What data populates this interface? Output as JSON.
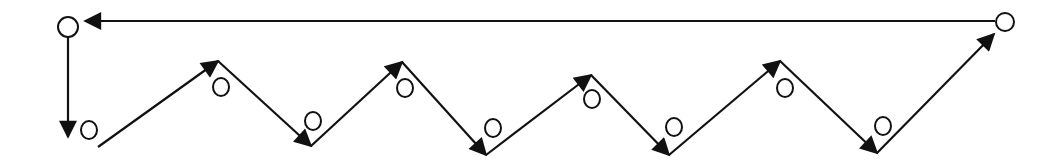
{
  "diagram": {
    "type": "zigzag-cycle-path",
    "stroke_color": "#111111",
    "background": "#ffffff",
    "top_line": {
      "from": [
        995,
        21
      ],
      "to": [
        85,
        21
      ],
      "direction": "right-to-left"
    },
    "corner_nodes": [
      {
        "name": "top-left-node",
        "cx": 68,
        "cy": 27,
        "r": 10
      },
      {
        "name": "top-right-node",
        "cx": 1005,
        "cy": 22,
        "r": 9
      }
    ],
    "down_line": {
      "from": [
        68,
        37
      ],
      "to": [
        68,
        137
      ]
    },
    "zigzag_points": [
      [
        98,
        147
      ],
      [
        218,
        61
      ],
      [
        311,
        146
      ],
      [
        402,
        62
      ],
      [
        486,
        155
      ],
      [
        591,
        75
      ],
      [
        669,
        155
      ],
      [
        780,
        61
      ],
      [
        877,
        153
      ],
      [
        994,
        34
      ]
    ],
    "small_nodes": [
      {
        "cx": 89,
        "cy": 130
      },
      {
        "cx": 221,
        "cy": 87
      },
      {
        "cx": 313,
        "cy": 121
      },
      {
        "cx": 405,
        "cy": 88
      },
      {
        "cx": 493,
        "cy": 128
      },
      {
        "cx": 592,
        "cy": 99
      },
      {
        "cx": 674,
        "cy": 127
      },
      {
        "cx": 785,
        "cy": 88
      },
      {
        "cx": 883,
        "cy": 126
      }
    ]
  }
}
